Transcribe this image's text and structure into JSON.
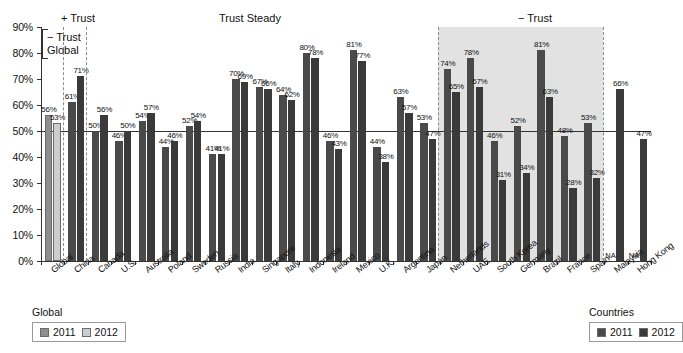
{
  "chart_data": {
    "type": "bar",
    "title": "",
    "xlabel": "",
    "ylabel": "",
    "ylim": [
      0,
      90
    ],
    "ytick_labels": [
      "0%",
      "10%",
      "20%",
      "30%",
      "40%",
      "50%",
      "60%",
      "70%",
      "80%",
      "90%"
    ],
    "ytick_values": [
      0,
      10,
      20,
      30,
      40,
      50,
      60,
      70,
      80,
      90
    ],
    "grid": false,
    "reference_line": 50,
    "categories": [
      "Global",
      "China",
      "Canada",
      "U.S.",
      "Australia",
      "Poland",
      "Sweden",
      "Russia",
      "India",
      "Singapore",
      "Italy",
      "Indonesia",
      "Ireland",
      "Mexico",
      "U.K.",
      "Argentina",
      "Japan",
      "Netherlands",
      "UAE",
      "South Korea",
      "Germany",
      "Brazil",
      "France",
      "Spain",
      "Malaysia",
      "Hong Kong"
    ],
    "series": [
      {
        "name": "2011",
        "values": [
          56,
          61,
          50,
          46,
          54,
          44,
          52,
          41,
          70,
          67,
          64,
          80,
          46,
          81,
          44,
          63,
          53,
          74,
          78,
          46,
          52,
          81,
          48,
          53,
          null,
          null
        ],
        "labels": [
          "56%",
          "61%",
          "50%",
          "46%",
          "54%",
          "44%",
          "52%",
          "41%",
          "70%",
          "67%",
          "64%",
          "80%",
          "46%",
          "81%",
          "44%",
          "63%",
          "53%",
          "74%",
          "78%",
          "46%",
          "52%",
          "81%",
          "48%",
          "53%",
          "NA",
          "NA"
        ]
      },
      {
        "name": "2012",
        "values": [
          53,
          71,
          56,
          50,
          57,
          46,
          54,
          41,
          69,
          66,
          62,
          78,
          43,
          77,
          38,
          57,
          47,
          65,
          67,
          31,
          34,
          63,
          28,
          32,
          66,
          47
        ],
        "labels": [
          "53%",
          "71%",
          "56%",
          "50%",
          "57%",
          "46%",
          "54%",
          "41%",
          "69%",
          "66%",
          "62%",
          "78%",
          "43%",
          "77%",
          "38%",
          "57%",
          "47%",
          "65%",
          "67%",
          "31%",
          "34%",
          "63%",
          "28%",
          "32%",
          "66%",
          "47%"
        ]
      }
    ],
    "annotations": [
      {
        "id": "minus-trust-global",
        "text": "− Trust\nGlobal",
        "position": "above-global"
      },
      {
        "id": "plus-trust",
        "text": "+ Trust",
        "position": "above-china"
      },
      {
        "id": "trust-steady",
        "text": "Trust Steady",
        "position": "above-canada-to-japan"
      },
      {
        "id": "minus-trust",
        "text": "− Trust",
        "position": "above-netherlands-to-spain"
      }
    ],
    "legends": [
      {
        "id": "global-legend",
        "title": "Global",
        "entries": [
          {
            "label": "2011",
            "color": "#8e8e8e"
          },
          {
            "label": "2012",
            "color": "#cdcdcd"
          }
        ],
        "position": "bottom-left"
      },
      {
        "id": "countries-legend",
        "title": "Countries",
        "entries": [
          {
            "label": "2011",
            "color": "#4a4a4a"
          },
          {
            "label": "2012",
            "color": "#3a3a3a"
          }
        ],
        "position": "bottom-right"
      }
    ],
    "colors": {
      "global_2011": "#8e8e8e",
      "global_2012": "#cdcdcd",
      "countries_2011": "#4a4a4a",
      "countries_2012": "#3a3a3a",
      "shaded_region": "#e2e2e2",
      "axis": "#333333"
    }
  },
  "annotations": {
    "minus_trust_global_line1": "− Trust",
    "minus_trust_global_line2": "Global",
    "plus_trust": "+ Trust",
    "trust_steady": "Trust Steady",
    "minus_trust": "− Trust"
  },
  "legend_global": {
    "title": "Global",
    "item1": "2011",
    "item2": "2012"
  },
  "legend_countries": {
    "title": "Countries",
    "item1": "2011",
    "item2": "2012"
  }
}
